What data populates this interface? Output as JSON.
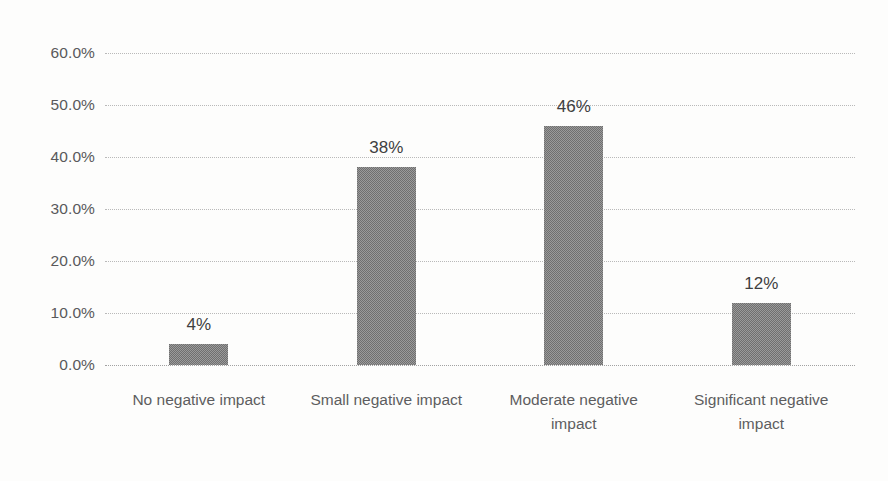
{
  "chart_data": {
    "type": "bar",
    "title": "",
    "xlabel": "",
    "ylabel": "",
    "categories": [
      "No negative impact",
      "Small negative impact",
      "Moderate negative impact",
      "Significant negative impact"
    ],
    "values": [
      4,
      38,
      46,
      12
    ],
    "data_labels": [
      "4%",
      "38%",
      "46%",
      "12%"
    ],
    "ylim": [
      0,
      60
    ],
    "ytick_values": [
      0,
      10,
      20,
      30,
      40,
      50,
      60
    ],
    "ytick_labels": [
      "0.0%",
      "10.0%",
      "20.0%",
      "30.0%",
      "40.0%",
      "50.0%",
      "60.0%"
    ],
    "grid": true,
    "gridline_style": "dotted",
    "legend": null,
    "legend_position": "none",
    "series": [
      {
        "name": "",
        "values": [
          4,
          38,
          46,
          12
        ]
      }
    ],
    "colors": {
      "bar_fill": "#6f6f6f",
      "gridline": "#b9b9b9",
      "axis_text": "#59595b",
      "data_label_text": "#3f3f41",
      "background": "#fdfdfc"
    }
  },
  "artifacts": {
    "mark_top_right": "",
    "mark_mid_right": "",
    "mark_bottom_right": ""
  }
}
